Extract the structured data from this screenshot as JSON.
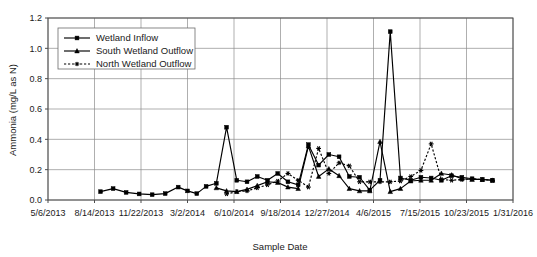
{
  "chart_data": {
    "type": "line",
    "title": "",
    "xlabel": "Sample Date",
    "ylabel": "Ammonia (mg/L as N)",
    "grid": true,
    "legend_position": "top-left",
    "ylim": [
      0.0,
      1.2
    ],
    "ytick_labels": [
      "0.0",
      "0.2",
      "0.4",
      "0.6",
      "0.8",
      "1.0",
      "1.2"
    ],
    "ytick_values": [
      0.0,
      0.2,
      0.4,
      0.6,
      0.8,
      1.0,
      1.2
    ],
    "xtick_labels": [
      "5/6/2013",
      "8/14/2013",
      "11/22/2013",
      "3/2/2014",
      "6/10/2014",
      "9/18/2014",
      "12/27/2014",
      "4/6/2015",
      "7/15/2015",
      "10/23/2015",
      "1/31/2016"
    ],
    "xtick_values": [
      0,
      100,
      200,
      300,
      400,
      500,
      600,
      700,
      800,
      900,
      1000
    ],
    "xlim": [
      0,
      1000
    ],
    "series": [
      {
        "name": "Wetland Inflow",
        "marker": "square",
        "linestyle": "solid",
        "color": "#000000",
        "x": [
          113,
          140,
          168,
          196,
          224,
          252,
          280,
          300,
          320,
          340,
          362,
          384,
          406,
          428,
          450,
          472,
          494,
          516,
          538,
          560,
          582,
          604,
          626,
          648,
          670,
          692,
          714,
          736,
          758,
          780,
          802,
          824,
          846,
          868,
          890,
          912,
          934,
          956
        ],
        "y": [
          0.055,
          0.075,
          0.05,
          0.04,
          0.035,
          0.042,
          0.085,
          0.06,
          0.042,
          0.09,
          0.11,
          0.48,
          0.13,
          0.12,
          0.155,
          0.13,
          0.175,
          0.12,
          0.1,
          0.365,
          0.23,
          0.3,
          0.285,
          0.155,
          0.15,
          0.065,
          0.13,
          1.11,
          0.145,
          0.13,
          0.15,
          0.145,
          0.13,
          0.16,
          0.15,
          0.14,
          0.135,
          0.13
        ]
      },
      {
        "name": "South Wetland Outflow",
        "marker": "triangle",
        "linestyle": "solid",
        "color": "#000000",
        "x": [
          362,
          384,
          406,
          428,
          450,
          472,
          494,
          516,
          538,
          560,
          582,
          604,
          626,
          648,
          670,
          692,
          714,
          736,
          758,
          780,
          802,
          824,
          846,
          868,
          890,
          912,
          934,
          956
        ],
        "y": [
          0.08,
          0.06,
          0.055,
          0.07,
          0.095,
          0.12,
          0.115,
          0.085,
          0.075,
          0.355,
          0.155,
          0.205,
          0.16,
          0.075,
          0.06,
          0.06,
          0.385,
          0.055,
          0.075,
          0.125,
          0.13,
          0.13,
          0.175,
          0.165,
          0.14,
          0.135,
          0.135,
          0.13
        ]
      },
      {
        "name": "North Wetland Outflow",
        "marker": "star",
        "linestyle": "dotted",
        "color": "#000000",
        "x": [
          384,
          406,
          428,
          450,
          472,
          494,
          516,
          538,
          560,
          582,
          604,
          626,
          648,
          670,
          692,
          714,
          736,
          758,
          780,
          802,
          824,
          846,
          868,
          890,
          912,
          934,
          956
        ],
        "y": [
          0.04,
          0.055,
          0.06,
          0.08,
          0.1,
          0.125,
          0.175,
          0.13,
          0.085,
          0.34,
          0.175,
          0.245,
          0.225,
          0.12,
          0.12,
          0.12,
          0.12,
          0.125,
          0.155,
          0.195,
          0.37,
          0.135,
          0.13,
          0.135,
          0.14,
          0.135,
          0.13
        ]
      }
    ]
  },
  "legend": {
    "items": [
      {
        "label": "Wetland Inflow"
      },
      {
        "label": "South Wetland Outflow"
      },
      {
        "label": "North Wetland Outflow"
      }
    ]
  }
}
